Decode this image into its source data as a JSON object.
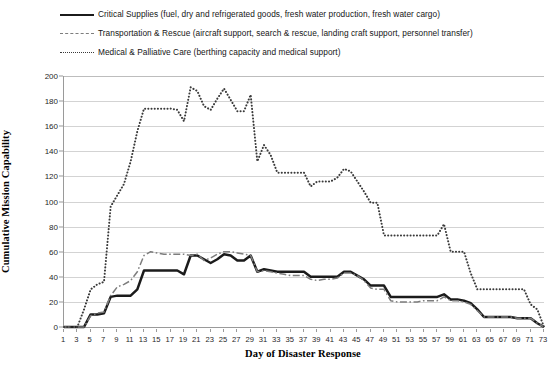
{
  "chart_data": {
    "type": "line",
    "title": "",
    "xlabel": "Day of Disaster Response",
    "ylabel": "Cumulative Mission Capability",
    "xlim": [
      1,
      73
    ],
    "ylim": [
      0,
      200
    ],
    "ytick_step": 20,
    "xtick_step": 2,
    "grid": true,
    "legend_position": "top",
    "x": [
      1,
      2,
      3,
      4,
      5,
      6,
      7,
      8,
      9,
      10,
      11,
      12,
      13,
      14,
      15,
      16,
      17,
      18,
      19,
      20,
      21,
      22,
      23,
      24,
      25,
      26,
      27,
      28,
      29,
      30,
      31,
      32,
      33,
      34,
      35,
      36,
      37,
      38,
      39,
      40,
      41,
      42,
      43,
      44,
      45,
      46,
      47,
      48,
      49,
      50,
      51,
      52,
      53,
      54,
      55,
      56,
      57,
      58,
      59,
      60,
      61,
      62,
      63,
      64,
      65,
      66,
      67,
      68,
      69,
      70,
      71,
      72,
      73
    ],
    "series": [
      {
        "name": "Critical Supplies",
        "style": "solid",
        "color": "#1b1b1b",
        "legend_label": "Critical Supplies (fuel, dry and refrigerated goods, fresh water production, fresh water cargo)",
        "values": [
          0,
          0,
          0,
          0,
          10,
          10,
          11,
          24,
          25,
          25,
          25,
          30,
          45,
          45,
          45,
          45,
          45,
          45,
          42,
          57,
          57,
          54,
          51,
          54,
          58,
          57,
          53,
          53,
          57,
          44,
          46,
          45,
          44,
          44,
          44,
          44,
          44,
          40,
          40,
          40,
          40,
          40,
          44,
          44,
          41,
          38,
          33,
          33,
          33,
          24,
          24,
          24,
          24,
          24,
          24,
          24,
          24,
          26,
          22,
          22,
          21,
          19,
          14,
          8,
          8,
          8,
          8,
          8,
          7,
          7,
          7,
          3,
          0
        ]
      },
      {
        "name": "Transportation & Rescue",
        "style": "dashdot",
        "color": "#7d7d7d",
        "legend_label": "Transportation & Rescue (aircraft support, search & rescue, landing craft support, personnel transfer)",
        "values": [
          0,
          0,
          0,
          0,
          9,
          11,
          12,
          25,
          32,
          34,
          37,
          44,
          57,
          60,
          59,
          58,
          58,
          58,
          58,
          57,
          58,
          53,
          55,
          58,
          60,
          60,
          59,
          58,
          57,
          44,
          45,
          44,
          43,
          42,
          41,
          41,
          41,
          38,
          37,
          38,
          38,
          39,
          43,
          43,
          41,
          37,
          31,
          30,
          30,
          21,
          20,
          20,
          20,
          20,
          21,
          21,
          21,
          24,
          21,
          21,
          20,
          18,
          13,
          8,
          8,
          8,
          8,
          8,
          7,
          7,
          7,
          3,
          0
        ]
      },
      {
        "name": "Medical & Palliative Care",
        "style": "dotted",
        "color": "#3a3a3a",
        "legend_label": "Medical & Palliative Care (berthing capacity and medical support)",
        "values": [
          0,
          0,
          0,
          14,
          30,
          34,
          36,
          96,
          105,
          114,
          132,
          156,
          174,
          174,
          174,
          174,
          174,
          173,
          164,
          191,
          188,
          176,
          173,
          182,
          190,
          181,
          172,
          172,
          185,
          132,
          145,
          137,
          123,
          123,
          123,
          123,
          123,
          112,
          116,
          116,
          116,
          119,
          126,
          124,
          116,
          108,
          99,
          99,
          73,
          73,
          73,
          73,
          73,
          73,
          73,
          73,
          73,
          82,
          60,
          60,
          60,
          43,
          30,
          30,
          30,
          30,
          30,
          30,
          30,
          30,
          18,
          14,
          0
        ]
      }
    ]
  },
  "legend": {
    "items": [
      {
        "key": "solid",
        "label": "Critical Supplies (fuel, dry and refrigerated goods, fresh water production, fresh water cargo)"
      },
      {
        "key": "dashdot",
        "label": "Transportation & Rescue (aircraft support, search & rescue, landing craft support, personnel transfer)"
      },
      {
        "key": "dotted",
        "label": "Medical & Palliative Care (berthing capacity and medical support)"
      }
    ]
  },
  "axes": {
    "y_title": "Cumulative Mission Capability",
    "x_title": "Day of Disaster Response",
    "y_ticks": [
      0,
      20,
      40,
      60,
      80,
      100,
      120,
      140,
      160,
      180,
      200
    ],
    "x_ticks": [
      1,
      3,
      5,
      7,
      9,
      11,
      13,
      15,
      17,
      19,
      21,
      23,
      25,
      27,
      29,
      31,
      33,
      35,
      37,
      39,
      41,
      43,
      45,
      47,
      49,
      51,
      53,
      55,
      57,
      59,
      61,
      63,
      65,
      67,
      69,
      71,
      73
    ]
  }
}
